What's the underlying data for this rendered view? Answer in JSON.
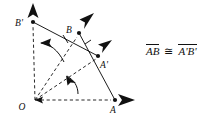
{
  "figure": {
    "points": [
      {
        "id": "O",
        "label": "O",
        "x": 35,
        "y": 100,
        "label_x": 22,
        "label_y": 110,
        "has_dot": false,
        "arrow": null
      },
      {
        "id": "A",
        "label": "A",
        "x": 115,
        "y": 100,
        "label_x": 113,
        "label_y": 113,
        "has_dot": true,
        "arrow": "right"
      },
      {
        "id": "B",
        "label": "B",
        "x": 79,
        "y": 33,
        "label_x": 67,
        "label_y": 33,
        "has_dot": true,
        "arrow": "up-right"
      },
      {
        "id": "Ap",
        "label": "A'",
        "x": 98,
        "y": 56,
        "label_x": 101,
        "label_y": 68,
        "has_dot": true,
        "arrow": "up-right"
      },
      {
        "id": "Bp",
        "label": "B'",
        "x": 33,
        "y": 22,
        "label_x": 17,
        "label_y": 23,
        "has_dot": true,
        "arrow": "up"
      }
    ],
    "solid_segments": [
      {
        "name": "segment-BprimeAprime",
        "from": "Bp",
        "to": "Ap",
        "tick": true
      },
      {
        "name": "segment-BA",
        "from": "B",
        "to": "A",
        "tick": true
      }
    ],
    "dashed_rays": [
      {
        "name": "ray-O-to-Bprime",
        "from": "O",
        "to": "Bp"
      },
      {
        "name": "ray-O-to-B",
        "from": "O",
        "to": "B"
      },
      {
        "name": "ray-O-to-Aprime",
        "from": "O",
        "to": "Ap"
      },
      {
        "name": "ray-O-to-A",
        "from": "O",
        "to": "A"
      }
    ],
    "rotation_arcs": [
      {
        "name": "rotation-arc-upper",
        "direction": "counterclockwise",
        "from_ray": "ray-O-to-B",
        "to_ray": "ray-O-to-Bprime"
      },
      {
        "name": "rotation-arc-lower",
        "direction": "counterclockwise",
        "from_ray": "ray-O-to-A",
        "to_ray": "ray-O-to-Aprime"
      }
    ],
    "colors": {
      "ink": "#111111",
      "background": "#ffffff"
    }
  },
  "congruence": {
    "left_segment": "AB",
    "symbol": "≅",
    "right_segment": "A'B'"
  }
}
